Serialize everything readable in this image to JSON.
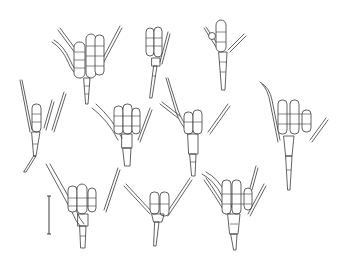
{
  "figure": {
    "type": "scientific line drawing",
    "specimen_count": 11,
    "scale_bar": {
      "label": "",
      "orientation": "vertical"
    },
    "line_color": "#3a3a3a",
    "background": "#ffffff"
  }
}
